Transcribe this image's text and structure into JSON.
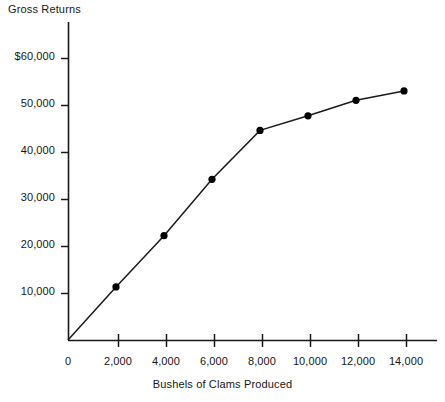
{
  "chart_data": {
    "type": "line",
    "title": "Gross Returns",
    "xlabel": "Bushels of Clams Produced",
    "ylabel": "Gross Returns",
    "x": [
      0,
      2000,
      4000,
      6000,
      8000,
      10000,
      12000,
      14000
    ],
    "values": [
      0,
      11300,
      22200,
      34200,
      44600,
      47700,
      51000,
      53000
    ],
    "series": [
      {
        "name": "Gross Returns",
        "values": [
          0,
          11300,
          22200,
          34200,
          44600,
          47700,
          51000,
          53000
        ]
      }
    ],
    "xlim": [
      0,
      15500
    ],
    "ylim": [
      0,
      63000
    ],
    "xticks": [
      0,
      2000,
      4000,
      6000,
      8000,
      10000,
      12000,
      14000
    ],
    "xtick_labels": [
      "0",
      "2,000",
      "4,000",
      "6,000",
      "8,000",
      "10,000",
      "12,000",
      "14,000"
    ],
    "yticks": [
      10000,
      20000,
      30000,
      40000,
      50000,
      60000
    ],
    "ytick_labels": [
      "10,000",
      "20,000",
      "30,000",
      "40,000",
      "50,000",
      "$60,000"
    ],
    "grid": false,
    "legend": false,
    "marker": "filled-circle",
    "line_color": "#1a1a1a",
    "marker_color": "#000000",
    "axis_color": "#1a1a1a",
    "background": "#ffffff"
  },
  "axis": {
    "y_labels": [
      {
        "text": "$60,000",
        "top": 50
      },
      {
        "text": "50,000",
        "top": 97
      },
      {
        "text": "40,000",
        "top": 144
      },
      {
        "text": "30,000",
        "top": 191
      },
      {
        "text": "20,000",
        "top": 238
      },
      {
        "text": "10,000",
        "top": 285
      }
    ],
    "x_labels": [
      {
        "text": "0",
        "left": 68
      },
      {
        "text": "2,000",
        "left": 118
      },
      {
        "text": "4,000",
        "left": 166
      },
      {
        "text": "6,000",
        "left": 214
      },
      {
        "text": "8,000",
        "left": 262
      },
      {
        "text": "10,000",
        "left": 310
      },
      {
        "text": "12,000",
        "left": 358
      },
      {
        "text": "14,000",
        "left": 406
      }
    ]
  }
}
